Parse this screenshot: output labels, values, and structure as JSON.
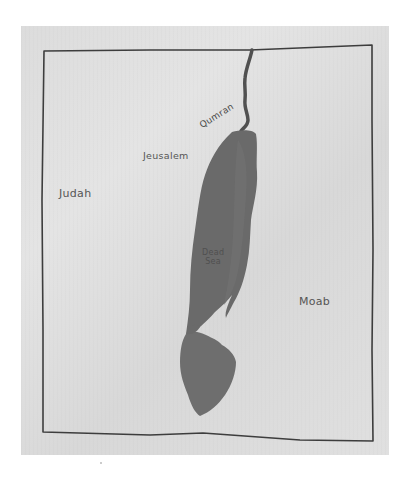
{
  "map": {
    "title": "",
    "medium": "hand-drawn pencil and watercolor sketch",
    "regions": [
      {
        "id": "judah",
        "label": "Judah"
      },
      {
        "id": "moab",
        "label": "Moab"
      }
    ],
    "places": [
      {
        "id": "jerusalem",
        "label": "Jeusalem"
      },
      {
        "id": "qumran",
        "label": "Qumran"
      }
    ],
    "water_bodies": [
      {
        "id": "dead-sea",
        "label_line1": "Dead",
        "label_line2": "Sea"
      }
    ],
    "rivers": [
      {
        "id": "jordan-river",
        "label": ""
      }
    ],
    "colors": {
      "paper": "#dedede",
      "border": "#3a3a3a",
      "water": "#6b6b6b",
      "water_light": "#7a7a7a",
      "text": "#555555"
    }
  }
}
